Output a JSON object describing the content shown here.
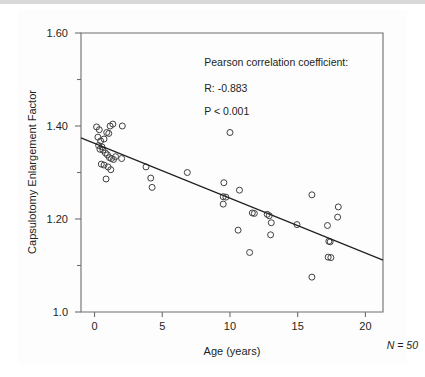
{
  "figure": {
    "n_note": "N = 50"
  },
  "chart_data": {
    "type": "scatter",
    "title": "",
    "xlabel": "Age (years)",
    "ylabel": "Capsulotomy Enlargement Factor",
    "xlim": [
      -1.0,
      21.3
    ],
    "ylim": [
      1.0,
      1.6
    ],
    "grid": false,
    "legend": null,
    "x_ticks": [
      0,
      5,
      10,
      15,
      20
    ],
    "x_tick_labels": [
      "0",
      "5",
      "10",
      "15",
      "20"
    ],
    "y_ticks": [
      1.0,
      1.1,
      1.2,
      1.3,
      1.4,
      1.5,
      1.6
    ],
    "y_tick_labels": [
      "1.0",
      "",
      "1.20",
      "",
      "1.40",
      "",
      "1.60"
    ],
    "y_major_ticks": [
      1.0,
      1.2,
      1.4,
      1.6
    ],
    "y_minor_ticks": [
      1.1,
      1.3,
      1.5
    ],
    "annotations": [
      {
        "id": "pearson-heading",
        "text": "Pearson correlation coefficient:",
        "x": 8.1,
        "y": 1.528
      },
      {
        "id": "r-value",
        "text": "R: -0.883",
        "x": 8.1,
        "y": 1.474
      },
      {
        "id": "p-value",
        "text": "P < 0.001",
        "x": 8.1,
        "y": 1.423
      }
    ],
    "fit_line": {
      "type": "linear-regression",
      "x_start": -1.0,
      "y_start": 1.3745,
      "x_end": 21.3,
      "y_end": 1.1115,
      "slope": -0.0118,
      "intercept": 1.3627
    },
    "marker": {
      "shape": "open-circle",
      "radius_px": 3.0,
      "stroke": "#414042",
      "fill": "none"
    },
    "n": 50,
    "points": [
      {
        "x": 0.15,
        "y": 1.398
      },
      {
        "x": 0.35,
        "y": 1.392
      },
      {
        "x": 0.25,
        "y": 1.376
      },
      {
        "x": 0.45,
        "y": 1.368
      },
      {
        "x": 0.3,
        "y": 1.358
      },
      {
        "x": 0.55,
        "y": 1.355
      },
      {
        "x": 0.4,
        "y": 1.35
      },
      {
        "x": 0.62,
        "y": 1.348
      },
      {
        "x": 0.7,
        "y": 1.372
      },
      {
        "x": 0.9,
        "y": 1.386
      },
      {
        "x": 1.05,
        "y": 1.384
      },
      {
        "x": 1.15,
        "y": 1.4
      },
      {
        "x": 1.35,
        "y": 1.404
      },
      {
        "x": 0.8,
        "y": 1.342
      },
      {
        "x": 0.95,
        "y": 1.338
      },
      {
        "x": 1.1,
        "y": 1.332
      },
      {
        "x": 1.25,
        "y": 1.33
      },
      {
        "x": 1.4,
        "y": 1.328
      },
      {
        "x": 1.55,
        "y": 1.334
      },
      {
        "x": 0.5,
        "y": 1.318
      },
      {
        "x": 0.7,
        "y": 1.316
      },
      {
        "x": 1.0,
        "y": 1.312
      },
      {
        "x": 1.2,
        "y": 1.306
      },
      {
        "x": 0.85,
        "y": 1.286
      },
      {
        "x": 2.05,
        "y": 1.4
      },
      {
        "x": 2.0,
        "y": 1.33
      },
      {
        "x": 3.8,
        "y": 1.312
      },
      {
        "x": 4.15,
        "y": 1.288
      },
      {
        "x": 4.25,
        "y": 1.268
      },
      {
        "x": 6.85,
        "y": 1.3
      },
      {
        "x": 9.55,
        "y": 1.278
      },
      {
        "x": 9.5,
        "y": 1.248
      },
      {
        "x": 9.7,
        "y": 1.247
      },
      {
        "x": 9.5,
        "y": 1.232
      },
      {
        "x": 10.0,
        "y": 1.386
      },
      {
        "x": 10.7,
        "y": 1.262
      },
      {
        "x": 10.6,
        "y": 1.176
      },
      {
        "x": 11.45,
        "y": 1.128
      },
      {
        "x": 11.65,
        "y": 1.213
      },
      {
        "x": 11.8,
        "y": 1.212
      },
      {
        "x": 12.75,
        "y": 1.21
      },
      {
        "x": 12.9,
        "y": 1.207
      },
      {
        "x": 13.05,
        "y": 1.192
      },
      {
        "x": 13.0,
        "y": 1.166
      },
      {
        "x": 14.95,
        "y": 1.188
      },
      {
        "x": 16.05,
        "y": 1.252
      },
      {
        "x": 16.05,
        "y": 1.075
      },
      {
        "x": 17.2,
        "y": 1.186
      },
      {
        "x": 17.3,
        "y": 1.152
      },
      {
        "x": 17.4,
        "y": 1.151
      },
      {
        "x": 17.25,
        "y": 1.118
      },
      {
        "x": 17.45,
        "y": 1.117
      },
      {
        "x": 18.0,
        "y": 1.226
      },
      {
        "x": 17.95,
        "y": 1.204
      }
    ]
  }
}
